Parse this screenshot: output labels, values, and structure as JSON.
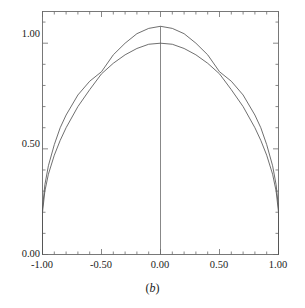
{
  "caption": {
    "prefix": "(",
    "letter": "b",
    "suffix": ")"
  },
  "chart_data": {
    "type": "line",
    "title": "",
    "subtitle": "",
    "xlabel": "",
    "ylabel": "",
    "xlim": [
      -1.0,
      1.0
    ],
    "ylim": [
      0.0,
      1.15
    ],
    "grid": false,
    "legend": "none",
    "annotations": [
      "(b)"
    ],
    "x_ticks_major": [
      -1.0,
      -0.5,
      0.0,
      0.5,
      1.0
    ],
    "x_tick_labels": [
      "-1.00",
      "-0.50",
      "0.00",
      "0.50",
      "1.00"
    ],
    "x_minor_tick_count_per_interval": 5,
    "y_ticks_major": [
      0.0,
      0.5,
      1.0
    ],
    "y_tick_labels": [
      "0.00",
      "0.50",
      "1.00"
    ],
    "y_minor_tick_count_per_interval": 5,
    "ticks_direction": "inward",
    "frame": "box",
    "vertical_center_line": {
      "x": 0.0,
      "y_from": 0.0,
      "y_to": 1.08
    },
    "series": [
      {
        "name": "curve-1",
        "color": "#555555",
        "peak": {
          "x": 0.0,
          "y": 1.0
        },
        "x": [
          -1.0,
          -1.0,
          -0.98,
          -0.95,
          -0.9,
          -0.85,
          -0.8,
          -0.7,
          -0.6,
          -0.5,
          -0.4,
          -0.3,
          -0.2,
          -0.1,
          0.0,
          0.1,
          0.2,
          0.3,
          0.4,
          0.5,
          0.6,
          0.7,
          0.8,
          0.85,
          0.9,
          0.95,
          0.98,
          1.0,
          1.0
        ],
        "y": [
          0.0,
          0.2,
          0.3,
          0.38,
          0.47,
          0.54,
          0.6,
          0.7,
          0.78,
          0.855,
          0.905,
          0.945,
          0.975,
          0.995,
          1.0,
          0.995,
          0.975,
          0.945,
          0.905,
          0.855,
          0.78,
          0.7,
          0.6,
          0.54,
          0.47,
          0.38,
          0.3,
          0.2,
          0.0
        ]
      },
      {
        "name": "curve-2",
        "color": "#555555",
        "peak": {
          "x": 0.0,
          "y": 1.08
        },
        "x": [
          -1.0,
          -1.0,
          -0.98,
          -0.95,
          -0.9,
          -0.85,
          -0.8,
          -0.7,
          -0.6,
          -0.5,
          -0.4,
          -0.3,
          -0.2,
          -0.1,
          0.0,
          0.1,
          0.2,
          0.3,
          0.4,
          0.5,
          0.6,
          0.7,
          0.8,
          0.85,
          0.9,
          0.95,
          0.98,
          1.0,
          1.0
        ],
        "y": [
          0.0,
          0.22,
          0.33,
          0.42,
          0.52,
          0.6,
          0.66,
          0.755,
          0.82,
          0.865,
          0.945,
          1.0,
          1.045,
          1.07,
          1.08,
          1.07,
          1.045,
          1.0,
          0.945,
          0.865,
          0.82,
          0.755,
          0.66,
          0.6,
          0.52,
          0.42,
          0.33,
          0.22,
          0.0
        ]
      }
    ],
    "intersections": [
      {
        "x": -0.48,
        "y": 0.862
      },
      {
        "x": 0.48,
        "y": 0.862
      }
    ],
    "axis_color": "#6a6a6a"
  }
}
